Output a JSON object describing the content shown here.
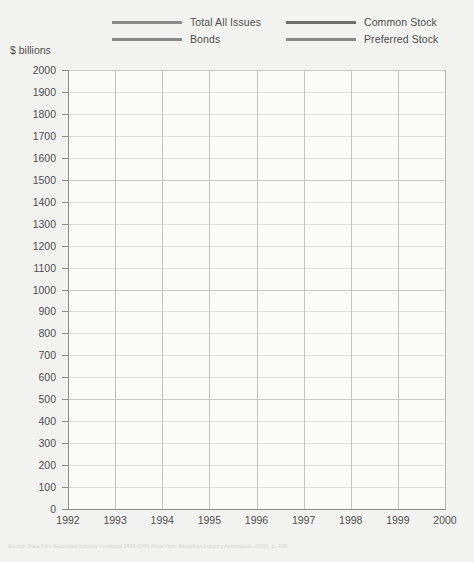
{
  "axis_title": "$ billions",
  "legend": {
    "items": [
      {
        "label": "Total All Issues",
        "color": "#8a8a8a",
        "slot": "c0"
      },
      {
        "label": "Bonds",
        "color": "#8a8a8a",
        "slot": "c1"
      },
      {
        "label": "Common Stock",
        "color": "#6e6e6e",
        "slot": "c2"
      },
      {
        "label": "Preferred Stock",
        "color": "#8a8a8a",
        "slot": "c3"
      }
    ]
  },
  "source_note": "Source: Data from Securities Industry Yearbook 1999-2000 (New York: Securities Industry Association, 2000), p. 339.",
  "chart_data": {
    "type": "line",
    "title": "",
    "xlabel": "",
    "ylabel": "$ billions",
    "ylim": [
      0,
      2000
    ],
    "ytick_step": 100,
    "ytick_labels": [
      "2000",
      "1900",
      "1800",
      "1700",
      "1600",
      "1500",
      "1400",
      "1300",
      "1200",
      "1100",
      "1000",
      "900",
      "800",
      "700",
      "600",
      "500",
      "400",
      "300",
      "200",
      "100",
      "0"
    ],
    "grid": true,
    "legend_position": "top",
    "categories": [
      "1992",
      "1993",
      "1994",
      "1995",
      "1996",
      "1997",
      "1998",
      "1999",
      "2000"
    ],
    "series": [
      {
        "name": "Total All Issues",
        "color": "#8a8a8a",
        "values": [
          850,
          1050,
          700,
          700,
          840,
          1340,
          1870,
          1950,
          1850
        ]
      },
      {
        "name": "Bonds",
        "color": "#8a8a8a",
        "values": [
          730,
          910,
          620,
          600,
          740,
          1180,
          1710,
          1760,
          1650
        ]
      },
      {
        "name": "Common Stock",
        "color": "#6e6e6e",
        "values": [
          72,
          102,
          62,
          82,
          115,
          120,
          115,
          165,
          180
        ]
      },
      {
        "name": "Preferred Stock",
        "color": "#8a8a8a",
        "values": [
          29,
          28,
          17,
          15,
          27,
          34,
          38,
          30,
          22
        ]
      }
    ]
  }
}
